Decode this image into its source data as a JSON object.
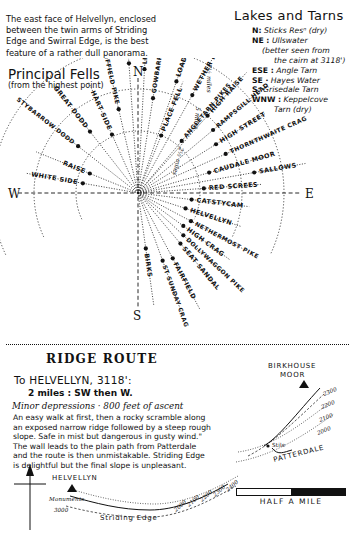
{
  "intro": {
    "lines": [
      "   The east face of Helvellyn, enclosed",
      "between the twin arms of Striding",
      "Edge and Swirral Edge, is the best",
      "feature of a rather dull panorama."
    ]
  },
  "lakes_and_tarns": {
    "title": "Lakes and Tarns",
    "entries": [
      {
        "key": "N:",
        "value": "Sticks Resⁿ (dry)",
        "indent": 1
      },
      {
        "key": "NE :",
        "value": "Ullswater",
        "indent": 1
      },
      {
        "key": "",
        "value": "(better seen from",
        "indent": 2
      },
      {
        "key": "",
        "value": "the cairn at 3118')",
        "indent": 3
      },
      {
        "key": "ESE :",
        "value": "Angle Tarn",
        "indent": 1
      },
      {
        "key": "SE ·",
        "value": "Hayes Water",
        "indent": 1
      },
      {
        "key": "S:",
        "value": "Grisedale Tarn",
        "indent": 1
      },
      {
        "key": "WNW :",
        "value": "Keppelcove",
        "indent": 1
      },
      {
        "key": "",
        "value": "Tarn (dry)",
        "indent": 3
      }
    ]
  },
  "principal_fells": {
    "title": "Principal Fells",
    "subtitle": "(from the highest point)",
    "cardinals": [
      "N",
      "E",
      "S",
      "W"
    ],
    "rings": [
      "2½ miles",
      "5 miles",
      "7½ miles"
    ],
    "peaks": [
      {
        "name": "STYBARROW DODD",
        "angle": -52,
        "radius": 76
      },
      {
        "name": "GREAT DODD",
        "angle": -38,
        "radius": 78
      },
      {
        "name": "HART SIDE",
        "angle": -24,
        "radius": 64
      },
      {
        "name": "SHEFFIELD PIKE",
        "angle": -13,
        "radius": 86
      },
      {
        "name": "GREAT MELL FELL",
        "angle": -4,
        "radius": 130
      },
      {
        "name": "LITTLE MELL FELL",
        "angle": 3,
        "radius": 124
      },
      {
        "name": "GOWBARROW FELL",
        "angle": 9,
        "radius": 96
      },
      {
        "name": "PLACE FELL",
        "angle": 22,
        "radius": 62
      },
      {
        "name": "LOADPOT HILL",
        "angle": 19,
        "radius": 118
      },
      {
        "name": "WETHER HILL",
        "angle": 29,
        "radius": 112
      },
      {
        "name": "ANGLETARN PIKES",
        "angle": 40,
        "radius": 68
      },
      {
        "name": "HIGH RAISE",
        "angle": 42,
        "radius": 104
      },
      {
        "name": "RAMPSGILL HEAD",
        "angle": 50,
        "radius": 98
      },
      {
        "name": "HIGH STREET",
        "angle": 58,
        "radius": 92
      },
      {
        "name": "THORNTHWAITE CRAG",
        "angle": 66,
        "radius": 96
      },
      {
        "name": "CAUDALE MOOR",
        "angle": 74,
        "radius": 74
      },
      {
        "name": "RED SCREES",
        "angle": 86,
        "radius": 66
      },
      {
        "name": "SALLOWS",
        "angle": 80,
        "radius": 118
      },
      {
        "name": "RAISE",
        "angle": -68,
        "radius": 52
      },
      {
        "name": "WHITE SIDE",
        "angle": -80,
        "radius": 56
      },
      {
        "name": "CATSTYCAM",
        "angle": 97,
        "radius": 54
      },
      {
        "name": "HELVELLYN",
        "angle": 108,
        "radius": 50
      },
      {
        "name": "NETHERMOST PIKE",
        "angle": 118,
        "radius": 60
      },
      {
        "name": "HIGH CRAG",
        "angle": 126,
        "radius": 56
      },
      {
        "name": "DOLLYWAGGON PIKE",
        "angle": 133,
        "radius": 62
      },
      {
        "name": "SEAT SANDAL",
        "angle": 140,
        "radius": 66
      },
      {
        "name": "FAIRFIELD",
        "angle": 152,
        "radius": 74
      },
      {
        "name": "ST SUNDAY CRAG",
        "angle": 160,
        "radius": 72
      },
      {
        "name": "BIRKS",
        "angle": 172,
        "radius": 56
      }
    ]
  },
  "ridge_route": {
    "title": "RIDGE ROUTE",
    "destination": "To HELVELLYN, 3118':",
    "distance": "2 miles : SW then W.",
    "minor": "Minor depressions · 800 feet of ascent",
    "body": [
      "An easy walk at first, then a rocky scramble along",
      "an exposed narrow ridge followed by a steep rough",
      "slope.  Safe in mist but dangerous in gusty wind.\"",
      "The wall leads to the plain path from Patterdale",
      "and the route is then unmistakable. Striding Edge",
      "is delightful but the final slope is unpleasant."
    ]
  },
  "profile": {
    "summit": "HELVELLYN",
    "monuments": "Monuments",
    "elevation": "3000",
    "ridge": "Striding Edge",
    "contours": [
      "2000",
      "2100",
      "2200",
      "2300",
      "2400"
    ]
  },
  "inset": {
    "moor": "BIRKHOUSE",
    "moor2": "MOOR",
    "stile": "Stile",
    "village": "PATTERDALE",
    "contours": [
      "2300",
      "2200",
      "2100",
      "2000"
    ]
  },
  "scale": {
    "label": "HALF A MILE"
  }
}
